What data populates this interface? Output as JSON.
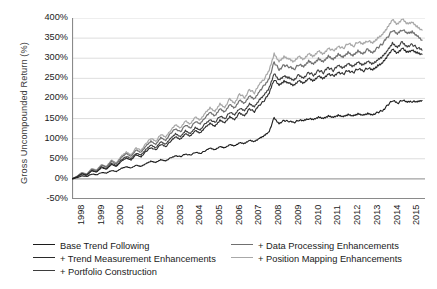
{
  "chart_data": {
    "type": "line",
    "title": "",
    "xlabel": "",
    "ylabel": "Gross Uncompounded Return (%)",
    "ylim": [
      -50,
      400
    ],
    "yticks": [
      "-50%",
      "0%",
      "50%",
      "100%",
      "150%",
      "200%",
      "250%",
      "300%",
      "350%",
      "400%"
    ],
    "ytick_values": [
      -50,
      0,
      50,
      100,
      150,
      200,
      250,
      300,
      350,
      400
    ],
    "xlim": [
      1998,
      2015.9
    ],
    "xticks": [
      "1998",
      "1999",
      "2000",
      "2001",
      "2002",
      "2003",
      "2004",
      "2005",
      "2006",
      "2007",
      "2008",
      "2009",
      "2010",
      "2011",
      "2012",
      "2013",
      "2014",
      "2015"
    ],
    "xtick_values": [
      1998,
      1999,
      2000,
      2001,
      2002,
      2003,
      2004,
      2005,
      2006,
      2007,
      2008,
      2009,
      2010,
      2011,
      2012,
      2013,
      2014,
      2015
    ],
    "grid": "horizontal",
    "legend_position": "below",
    "x": [
      1998.0,
      1998.25,
      1998.5,
      1998.75,
      1999.0,
      1999.25,
      1999.5,
      1999.75,
      2000.0,
      2000.25,
      2000.5,
      2000.75,
      2001.0,
      2001.25,
      2001.5,
      2001.75,
      2002.0,
      2002.25,
      2002.5,
      2002.75,
      2003.0,
      2003.25,
      2003.5,
      2003.75,
      2004.0,
      2004.25,
      2004.5,
      2004.75,
      2005.0,
      2005.25,
      2005.5,
      2005.75,
      2006.0,
      2006.25,
      2006.5,
      2006.75,
      2007.0,
      2007.25,
      2007.5,
      2007.75,
      2008.0,
      2008.25,
      2008.5,
      2008.75,
      2009.0,
      2009.25,
      2009.5,
      2009.75,
      2010.0,
      2010.25,
      2010.5,
      2010.75,
      2011.0,
      2011.25,
      2011.5,
      2011.75,
      2012.0,
      2012.25,
      2012.5,
      2012.75,
      2013.0,
      2013.25,
      2013.5,
      2013.75,
      2014.0,
      2014.25,
      2014.5,
      2014.75,
      2015.0,
      2015.25,
      2015.5,
      2015.75
    ],
    "series": [
      {
        "name": "Base Trend Following",
        "color": "#1c1c1c",
        "width": 1.1,
        "final_value": 195,
        "values": [
          0,
          3,
          8,
          6,
          12,
          10,
          16,
          14,
          21,
          18,
          26,
          30,
          27,
          34,
          31,
          38,
          44,
          41,
          48,
          45,
          52,
          58,
          55,
          62,
          59,
          66,
          63,
          70,
          76,
          72,
          80,
          77,
          85,
          82,
          90,
          88,
          96,
          93,
          101,
          108,
          118,
          152,
          138,
          145,
          143,
          140,
          146,
          144,
          150,
          147,
          153,
          150,
          156,
          153,
          158,
          155,
          160,
          157,
          162,
          159,
          163,
          160,
          165,
          170,
          183,
          195,
          188,
          196,
          190,
          193,
          191,
          195
        ]
      },
      {
        "name": "+ Trend Measurement Enhancements",
        "color": "#2a2a2a",
        "width": 1.1,
        "final_value": 310,
        "values": [
          0,
          5,
          12,
          9,
          20,
          17,
          28,
          24,
          36,
          31,
          44,
          52,
          47,
          60,
          55,
          68,
          78,
          72,
          86,
          80,
          94,
          104,
          98,
          112,
          106,
          120,
          114,
          128,
          138,
          131,
          146,
          140,
          155,
          148,
          164,
          158,
          174,
          167,
          183,
          195,
          212,
          248,
          232,
          242,
          238,
          232,
          244,
          238,
          250,
          244,
          256,
          250,
          262,
          255,
          266,
          260,
          270,
          264,
          274,
          268,
          276,
          270,
          280,
          288,
          305,
          322,
          312,
          325,
          315,
          320,
          314,
          310
        ]
      },
      {
        "name": "+ Portfolio Construction",
        "color": "#3d3d3d",
        "width": 1.1,
        "final_value": 320,
        "values": [
          0,
          5,
          13,
          10,
          21,
          18,
          30,
          26,
          39,
          33,
          47,
          56,
          50,
          64,
          59,
          73,
          84,
          77,
          92,
          86,
          101,
          112,
          105,
          120,
          113,
          128,
          122,
          137,
          148,
          140,
          156,
          149,
          166,
          158,
          176,
          169,
          186,
          179,
          196,
          209,
          226,
          262,
          246,
          256,
          252,
          246,
          258,
          252,
          264,
          258,
          270,
          264,
          277,
          270,
          281,
          275,
          286,
          279,
          290,
          283,
          292,
          286,
          296,
          305,
          320,
          338,
          328,
          340,
          330,
          334,
          326,
          320
        ]
      },
      {
        "name": "+ Data Processing Enhancements",
        "color": "#707070",
        "width": 1.2,
        "final_value": 345,
        "values": [
          0,
          6,
          15,
          11,
          24,
          20,
          34,
          29,
          44,
          37,
          53,
          63,
          56,
          72,
          66,
          82,
          94,
          86,
          103,
          96,
          113,
          125,
          117,
          134,
          126,
          143,
          136,
          153,
          165,
          156,
          174,
          166,
          185,
          176,
          196,
          188,
          207,
          199,
          218,
          232,
          251,
          290,
          272,
          283,
          279,
          272,
          285,
          278,
          292,
          285,
          298,
          291,
          305,
          297,
          310,
          303,
          315,
          307,
          319,
          312,
          322,
          315,
          326,
          336,
          352,
          370,
          359,
          372,
          361,
          365,
          355,
          345
        ]
      },
      {
        "name": "+ Position Mapping Enhancements",
        "color": "#a8a8a8",
        "width": 1.2,
        "final_value": 370,
        "values": [
          0,
          6,
          16,
          12,
          26,
          22,
          36,
          31,
          47,
          40,
          57,
          67,
          60,
          77,
          71,
          88,
          101,
          93,
          111,
          103,
          121,
          134,
          126,
          144,
          136,
          154,
          146,
          164,
          177,
          168,
          187,
          178,
          199,
          189,
          211,
          202,
          222,
          214,
          234,
          249,
          269,
          310,
          291,
          303,
          298,
          291,
          305,
          297,
          312,
          305,
          319,
          311,
          326,
          318,
          331,
          324,
          337,
          329,
          341,
          334,
          344,
          337,
          349,
          359,
          376,
          396,
          384,
          398,
          386,
          390,
          379,
          370
        ]
      }
    ]
  },
  "legend": {
    "entries": [
      {
        "label": "Base Trend Following",
        "color": "#1c1c1c"
      },
      {
        "label": "+ Trend Measurement Enhancements",
        "color": "#2a2a2a"
      },
      {
        "label": "+ Portfolio Construction",
        "color": "#3d3d3d"
      },
      {
        "label": "+ Data Processing Enhancements",
        "color": "#707070"
      },
      {
        "label": "+ Position Mapping Enhancements",
        "color": "#a8a8a8"
      }
    ]
  },
  "style": {
    "grid_color": "#d4d4d4",
    "axis_color": "#8a8a8a",
    "background": "#ffffff",
    "text_color": "#222222"
  }
}
